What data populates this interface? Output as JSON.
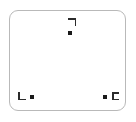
{
  "canvas": {
    "width": 136,
    "height": 122,
    "background_color": "#ffffff"
  },
  "frame": {
    "name": "rounded-rectangle-frame",
    "border_color": "#b9b9b9",
    "fill_color": "#ffffff",
    "corner_radius": 9,
    "x": 9,
    "y": 10,
    "width": 117,
    "height": 101
  },
  "markers": [
    {
      "id": "marker-top",
      "label": "top-center-marker",
      "dot_color": "#1a1a1a",
      "bracket_color": "#2b2b2b",
      "bracket_glyph": "top-right-corner-bracket",
      "bracket_position": "above",
      "x": 70,
      "y": 33
    },
    {
      "id": "marker-bottom-left",
      "label": "bottom-left-marker",
      "dot_color": "#1a1a1a",
      "bracket_color": "#2b2b2b",
      "bracket_glyph": "bottom-left-corner-bracket",
      "bracket_position": "left",
      "x": 32,
      "y": 97
    },
    {
      "id": "marker-bottom-right",
      "label": "bottom-right-marker",
      "dot_color": "#1a1a1a",
      "bracket_color": "#2b2b2b",
      "bracket_glyph": "left-facing-c-bracket",
      "bracket_position": "right",
      "x": 105,
      "y": 97
    }
  ]
}
